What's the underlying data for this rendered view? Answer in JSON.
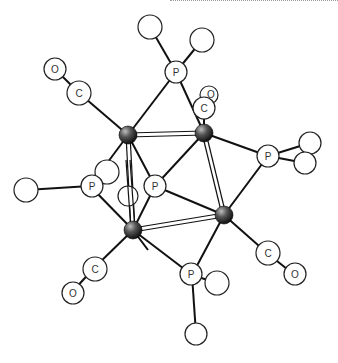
{
  "diagram": {
    "type": "molecular-structure",
    "atom_labels": {
      "phosphorus": "P",
      "carbon": "C",
      "oxygen": "O"
    },
    "metal_color": "#2a2a2a",
    "atoms": [
      {
        "id": "m1",
        "kind": "metal"
      },
      {
        "id": "m2",
        "kind": "metal"
      },
      {
        "id": "m3",
        "kind": "metal"
      },
      {
        "id": "m4",
        "kind": "metal"
      },
      {
        "id": "p1",
        "label": "P"
      },
      {
        "id": "p2",
        "label": "P"
      },
      {
        "id": "p3",
        "label": "P"
      },
      {
        "id": "p4",
        "label": "P"
      },
      {
        "id": "p5",
        "label": "P"
      },
      {
        "id": "c1",
        "label": "C"
      },
      {
        "id": "c2",
        "label": "C"
      },
      {
        "id": "c3",
        "label": "C"
      },
      {
        "id": "c4",
        "label": "C"
      },
      {
        "id": "o1",
        "label": "O"
      },
      {
        "id": "o2",
        "label": "O"
      },
      {
        "id": "o3",
        "label": "O"
      },
      {
        "id": "o4",
        "label": "O"
      }
    ]
  }
}
